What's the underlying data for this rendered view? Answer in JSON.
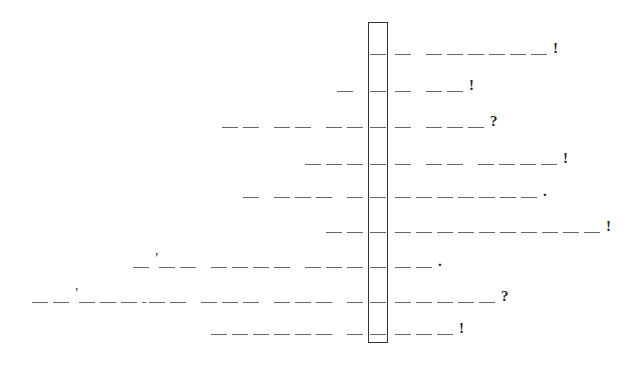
{
  "puzzle": {
    "type": "acrostic-blank-phrases",
    "highlight_box": {
      "x": 368,
      "y": 22,
      "width": 20,
      "height": 321
    },
    "legend": {
      "_": "letter blank",
      " ": "word gap",
      "'": "apostrophe",
      "-": "hyphen"
    },
    "rows": [
      {
        "y": 47,
        "left": "",
        "box": "_",
        "right": "_ ______!"
      },
      {
        "y": 84,
        "left": "_ ",
        "box": "_",
        "right": "_ __!"
      },
      {
        "y": 120,
        "left": "__ __ __",
        "box": "_",
        "right": "_ ___?"
      },
      {
        "y": 157,
        "left": "___",
        "box": "_",
        "right": "_ __ ____!"
      },
      {
        "y": 190,
        "left": "_ ___ _",
        "box": "_",
        "right": "_______."
      },
      {
        "y": 225,
        "left": "__",
        "box": "_",
        "right": "__________!"
      },
      {
        "y": 260,
        "left": "_'__ ____ ___",
        "box": "_",
        "right": "__."
      },
      {
        "y": 295,
        "left": "__'___-__ ___ ___ _",
        "box": "_",
        "right": "_____?"
      },
      {
        "y": 327,
        "left": "______ _",
        "box": "_",
        "right": "___!"
      }
    ]
  }
}
